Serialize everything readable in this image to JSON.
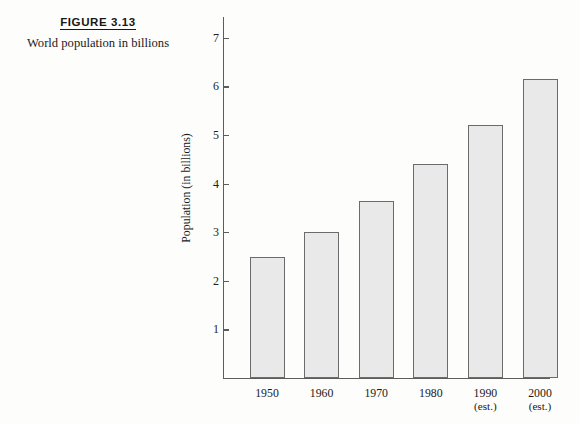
{
  "figure": {
    "number_label": "FIGURE 3.13",
    "title": "World population in billions"
  },
  "chart_data": {
    "type": "bar",
    "title": "World population in billions",
    "xlabel": "",
    "ylabel": "Population (in billions)",
    "categories": [
      "1950",
      "1960",
      "1970",
      "1980",
      "1990",
      "2000"
    ],
    "category_sublabels": [
      "",
      "",
      "",
      "",
      "(est.)",
      "(est.)"
    ],
    "values": [
      2.5,
      3.0,
      3.65,
      4.4,
      5.2,
      6.15
    ],
    "ylim": [
      0,
      7.4
    ],
    "y_ticks": [
      1,
      2,
      3,
      4,
      5,
      6,
      7
    ],
    "y_tick_labels": [
      "1",
      "2",
      "3",
      "4",
      "5",
      "6",
      "7"
    ],
    "grid": false,
    "legend": "none",
    "bar_fill_color": "#e9e9e9",
    "bar_edge_color": "#6b6b6b",
    "axis_color": "#5d5d5d",
    "background_color": "#fdfdfb"
  }
}
